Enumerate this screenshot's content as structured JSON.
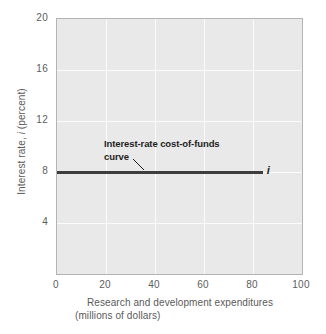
{
  "chart_data": {
    "type": "line",
    "title": "",
    "xlabel": "Research and development expenditures (millions of dollars)",
    "ylabel": "Interest rate, i (percent)",
    "xlim": [
      0,
      100
    ],
    "ylim": [
      0,
      20
    ],
    "grid": true,
    "legend_position": "none",
    "xticks": [
      "0",
      "20",
      "40",
      "60",
      "80",
      "100"
    ],
    "xtick_values": [
      0,
      20,
      40,
      60,
      80,
      100
    ],
    "yticks": [
      "4",
      "8",
      "12",
      "16",
      "20"
    ],
    "ytick_values": [
      4,
      8,
      12,
      16,
      20
    ],
    "series": [
      {
        "name": "Interest-rate cost-of-funds curve",
        "symbol": "i",
        "x": [
          0,
          84
        ],
        "values": [
          8,
          8
        ],
        "color": "#3d3d3d"
      }
    ],
    "annotations": [
      {
        "name": "curve-annotation",
        "line1": "Interest-rate cost-of-funds",
        "line2": "curve",
        "points_to": {
          "x": 36,
          "y": 8
        }
      },
      {
        "name": "series-end-label",
        "text": "i"
      }
    ]
  },
  "axis": {
    "y_title_prefix": "Interest rate, ",
    "y_title_symbol": "i",
    "y_title_suffix": " (percent)",
    "x_title_line1": "Research and development expenditures",
    "x_title_line2": "(millions of dollars)"
  },
  "colors": {
    "plot_background": "#e9e9e9",
    "gridline": "#fbfbfb",
    "plot_border": "#b4b4b4",
    "series_line": "#3d3d3d",
    "tick_label": "#5d5d5d",
    "axis_title": "#5a5a5a",
    "annotation_text": "#1d1d1d",
    "page_background": "#ffffff"
  }
}
